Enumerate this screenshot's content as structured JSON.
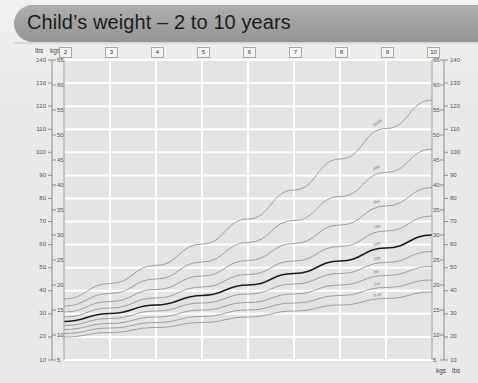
{
  "header": {
    "title": "Child’s weight – 2 to 10 years"
  },
  "axis_captions": {
    "top_left_lbs": "lbs",
    "top_left_kgs": "kgs",
    "bottom_right_kgs": "kgs",
    "bottom_right_lbs": "lbs"
  },
  "chart_data": {
    "type": "line",
    "title": "Child’s weight – 2 to 10 years",
    "xlabel": "Age (years)",
    "ylabel": "Weight",
    "xlim": [
      2,
      10
    ],
    "ylim_kg": [
      5,
      65
    ],
    "ylim_lb": [
      10,
      140
    ],
    "grid": true,
    "legend": "inline-curve-labels",
    "x_tick_labels": [
      "2",
      "3",
      "4",
      "5",
      "6",
      "7",
      "8",
      "9",
      "10"
    ],
    "x": [
      2,
      3,
      4,
      5,
      6,
      7,
      8,
      9,
      10
    ],
    "y_left_outer_unit": "lbs",
    "y_left_outer_ticks": [
      140,
      130,
      120,
      110,
      100,
      90,
      80,
      70,
      60,
      50,
      40,
      30,
      20,
      10
    ],
    "y_left_inner_unit": "kgs",
    "y_left_inner_ticks": [
      65,
      60,
      55,
      50,
      45,
      40,
      35,
      30,
      25,
      20,
      15,
      10,
      5
    ],
    "y_right_inner_unit": "kgs",
    "y_right_inner_ticks": [
      65,
      60,
      55,
      50,
      45,
      40,
      35,
      30,
      25,
      20,
      15,
      10,
      5
    ],
    "y_right_outer_unit": "lbs",
    "y_right_outer_ticks": [
      140,
      130,
      120,
      110,
      100,
      90,
      80,
      70,
      60,
      50,
      40,
      30,
      20,
      10
    ],
    "series": [
      {
        "name": "99.6th",
        "label": "99.6th",
        "emphasis": false,
        "values_kg": [
          17.2,
          20.3,
          23.9,
          28.2,
          33.2,
          39.0,
          45.2,
          51.3,
          57.0
        ]
      },
      {
        "name": "98th",
        "label": "98th",
        "emphasis": false,
        "values_kg": [
          15.8,
          18.3,
          21.2,
          24.6,
          28.5,
          32.9,
          37.7,
          42.5,
          47.2
        ]
      },
      {
        "name": "91st",
        "label": "91st",
        "emphasis": false,
        "values_kg": [
          14.6,
          16.7,
          19.1,
          21.8,
          24.9,
          28.3,
          32.0,
          35.8,
          39.5
        ]
      },
      {
        "name": "75th",
        "label": "75th",
        "emphasis": false,
        "values_kg": [
          13.6,
          15.4,
          17.4,
          19.6,
          22.1,
          24.8,
          27.7,
          30.8,
          33.8
        ]
      },
      {
        "name": "50th",
        "label": "50th",
        "emphasis": true,
        "values_kg": [
          12.7,
          14.3,
          16.0,
          17.9,
          20.0,
          22.3,
          24.8,
          27.4,
          30.0
        ]
      },
      {
        "name": "25th",
        "label": "25th",
        "emphasis": false,
        "values_kg": [
          11.9,
          13.3,
          14.8,
          16.4,
          18.2,
          20.2,
          22.3,
          24.5,
          26.7
        ]
      },
      {
        "name": "9th",
        "label": "9th",
        "emphasis": false,
        "values_kg": [
          11.1,
          12.3,
          13.6,
          15.0,
          16.5,
          18.2,
          20.0,
          21.9,
          23.7
        ]
      },
      {
        "name": "2nd",
        "label": "2nd",
        "emphasis": false,
        "values_kg": [
          10.3,
          11.4,
          12.5,
          13.7,
          15.0,
          16.4,
          17.9,
          19.5,
          21.0
        ]
      },
      {
        "name": "0.4th",
        "label": "0.4th",
        "emphasis": false,
        "values_kg": [
          9.6,
          10.5,
          11.5,
          12.5,
          13.6,
          14.8,
          16.0,
          17.3,
          18.6
        ]
      }
    ],
    "colors": {
      "background": "#e4e4e2",
      "gridline": "#ffffff",
      "curve": "#8a8a8a",
      "curve_emphasis": "#1a1a1a",
      "axis": "#8f8f8f",
      "header_band": "#9d9d9d",
      "text": "#333333"
    }
  }
}
